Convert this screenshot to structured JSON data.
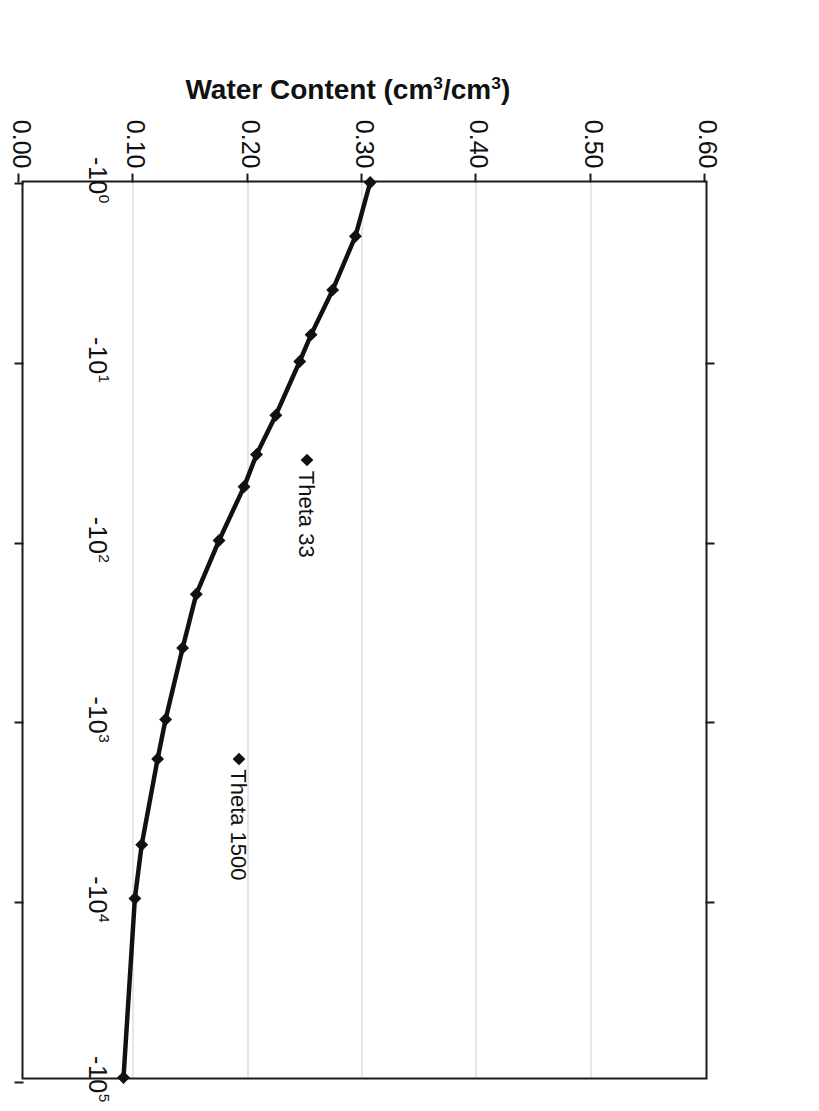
{
  "chart_data": {
    "type": "line",
    "title": "",
    "xlabel": "Soil Matric Potential (kPa)",
    "ylabel": "Water Content (cm3/cm3)",
    "ylabel_parts": {
      "lead": "Water Content (cm",
      "sup1": "3",
      "mid": "/cm",
      "sup2": "3",
      "tail": ")"
    },
    "xtick_labels": [
      "-100",
      "-101",
      "-102",
      "-103",
      "-104",
      "-105"
    ],
    "xticks": [
      {
        "base": "-10",
        "exp": "0",
        "value": -1
      },
      {
        "base": "-10",
        "exp": "1",
        "value": -10
      },
      {
        "base": "-10",
        "exp": "2",
        "value": -100
      },
      {
        "base": "-10",
        "exp": "3",
        "value": -1000
      },
      {
        "base": "-10",
        "exp": "4",
        "value": -10000
      },
      {
        "base": "-10",
        "exp": "5",
        "value": -100000
      }
    ],
    "ytick_labels": [
      "0.00",
      "0.10",
      "0.20",
      "0.30",
      "0.40",
      "0.50",
      "0.60"
    ],
    "ylim": [
      0.0,
      0.6
    ],
    "xlim_log10": [
      0,
      5
    ],
    "grid": "horizontal-dotted",
    "legend": "none",
    "line_color": "#111111",
    "marker": "diamond",
    "series": [
      {
        "name": "Water retention curve",
        "x_log10": [
          0.0,
          0.3,
          0.6,
          0.85,
          1.0,
          1.3,
          1.52,
          1.7,
          2.0,
          2.3,
          2.6,
          3.0,
          3.22,
          3.7,
          4.0,
          5.0
        ],
        "x_kPa": [
          -1,
          -2,
          -4,
          -7,
          -10,
          -20,
          -33,
          -50,
          -100,
          -200,
          -400,
          -1000,
          -1660,
          -5000,
          -10000,
          -100000
        ],
        "y": [
          0.305,
          0.292,
          0.272,
          0.253,
          0.243,
          0.222,
          0.205,
          0.194,
          0.172,
          0.152,
          0.14,
          0.125,
          0.118,
          0.104,
          0.098,
          0.088
        ]
      }
    ],
    "annotations": [
      {
        "label": "Theta 33",
        "marker": "diamond",
        "x_log10": 1.52,
        "y": 0.252
      },
      {
        "label": "Theta 1500",
        "marker": "diamond",
        "x_log10": 3.18,
        "y": 0.192
      }
    ]
  }
}
